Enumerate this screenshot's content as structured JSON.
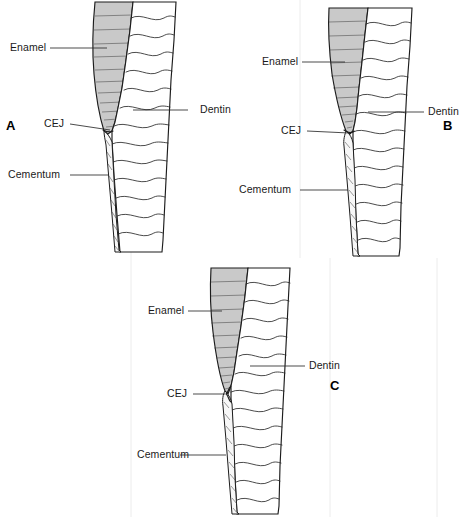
{
  "figure": {
    "caption": "",
    "background_color": "#ffffff",
    "line_color": "#1c1c1c",
    "enamel_color": "#c9c9c9",
    "dentin_color": "#ffffff",
    "cementum_color": "#f7f7f7",
    "label_color": "#1a1a1a"
  },
  "panels": [
    {
      "letter": "A",
      "labels": {
        "enamel": "Enamel",
        "dentin": "Dentin",
        "cej": "CEJ",
        "cementum": "Cementum"
      }
    },
    {
      "letter": "B",
      "labels": {
        "enamel": "Enamel",
        "dentin": "Dentin",
        "cej": "CEJ",
        "cementum": "Cementum"
      }
    },
    {
      "letter": "C",
      "labels": {
        "enamel": "Enamel",
        "dentin": "Dentin",
        "cej": "CEJ",
        "cementum": "Cementum"
      }
    }
  ]
}
